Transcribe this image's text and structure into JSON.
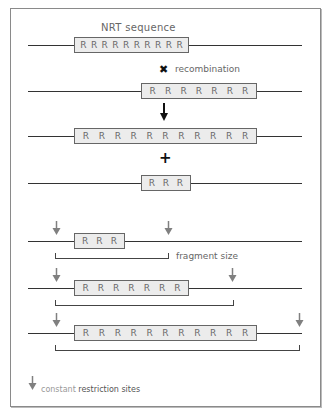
{
  "diagram": {
    "title_label": "NRT sequence",
    "recombination_label": "recombination",
    "fragment_size_label": "fragment size",
    "legend": {
      "word1": "constant",
      "word2": "restriction sites"
    },
    "rows": [
      {
        "id": "original",
        "repeat_count": 10,
        "repeats": [
          "R",
          "R",
          "R",
          "R",
          "R",
          "R",
          "R",
          "R",
          "R",
          "R"
        ]
      },
      {
        "id": "shifted",
        "repeat_count": 7,
        "repeats": [
          "R",
          "R",
          "R",
          "R",
          "R",
          "R",
          "R"
        ]
      },
      {
        "id": "expanded",
        "repeat_count": 11,
        "repeats": [
          "R",
          "R",
          "R",
          "R",
          "R",
          "R",
          "R",
          "R",
          "R",
          "R",
          "R"
        ]
      },
      {
        "id": "contracted",
        "repeat_count": 3,
        "repeats": [
          "R",
          "R",
          "R"
        ]
      },
      {
        "id": "digest-3",
        "repeat_count": 3,
        "repeats": [
          "R",
          "R",
          "R"
        ]
      },
      {
        "id": "digest-7",
        "repeat_count": 7,
        "repeats": [
          "R",
          "R",
          "R",
          "R",
          "R",
          "R",
          "R"
        ]
      },
      {
        "id": "digest-11",
        "repeat_count": 11,
        "repeats": [
          "R",
          "R",
          "R",
          "R",
          "R",
          "R",
          "R",
          "R",
          "R",
          "R",
          "R"
        ]
      }
    ],
    "symbols": {
      "cross": "✖",
      "down_arrow": "↓",
      "plus": "+"
    },
    "colors": {
      "frame": "#8a8a8a",
      "box_fill": "#ececec",
      "box_border": "#666666",
      "restriction_arrow": "#808080",
      "dna_line": "#333333"
    }
  }
}
